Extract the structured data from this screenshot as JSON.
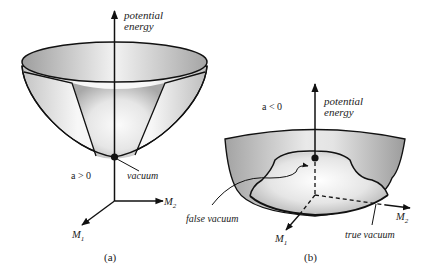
{
  "figure": {
    "panel_a": {
      "caption": "(a)",
      "axis_label_line1": "potential",
      "axis_label_line2": "energy",
      "condition": "a > 0",
      "minimum_label": "vacuum",
      "x_axis_label": "M",
      "x_axis_sub": "2",
      "y_axis_label": "M",
      "y_axis_sub": "1"
    },
    "panel_b": {
      "caption": "(b)",
      "axis_label_line1": "potential",
      "axis_label_line2": "energy",
      "condition": "a < 0",
      "local_min_label": "false vacuum",
      "global_min_label": "true vacuum",
      "x_axis_label": "M",
      "x_axis_sub": "2",
      "y_axis_label": "M",
      "y_axis_sub": "1"
    },
    "colors": {
      "line": "#111111",
      "surface_light": "#f6f6f6",
      "surface_dark": "#9a9a9a",
      "text": "#222222"
    }
  }
}
